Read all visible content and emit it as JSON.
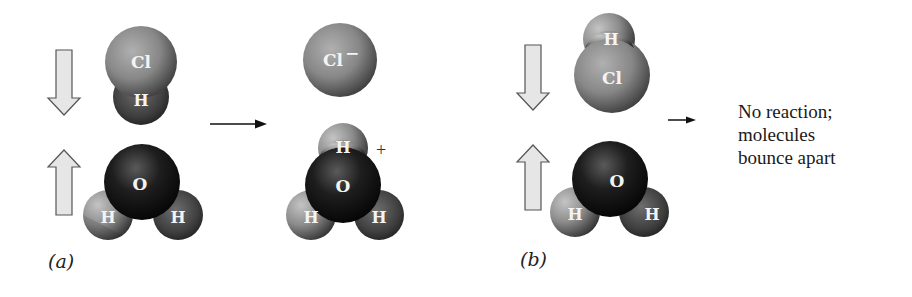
{
  "figure": {
    "panels": [
      {
        "id": "a",
        "label": "(a)",
        "reactants": [
          {
            "name": "hydrogen chloride",
            "atoms": [
              "Cl",
              "H"
            ],
            "motion": "down"
          },
          {
            "name": "water",
            "atoms": [
              "O",
              "H",
              "H"
            ],
            "motion": "up"
          }
        ],
        "arrow": "reaction-arrow",
        "products": [
          {
            "name": "chloride ion",
            "atoms": [
              "Cl"
            ],
            "label": "Cl",
            "charge": "−"
          },
          {
            "name": "hydronium ion",
            "atoms": [
              "H",
              "O",
              "H",
              "H"
            ],
            "charge": "+"
          }
        ]
      },
      {
        "id": "b",
        "label": "(b)",
        "reactants": [
          {
            "name": "hydrogen chloride",
            "atoms": [
              "H",
              "Cl"
            ],
            "motion": "down"
          },
          {
            "name": "water",
            "atoms": [
              "O",
              "H",
              "H"
            ],
            "motion": "up"
          }
        ],
        "arrow": "reaction-arrow",
        "outcome_lines": [
          "No reaction;",
          "molecules",
          "bounce apart"
        ]
      }
    ],
    "atom_labels": {
      "cl": "Cl",
      "h": "H",
      "o": "O",
      "cl_minus": "Cl",
      "minus": "−",
      "plus": "+"
    },
    "colors": {
      "chlorine": "#8a8a8a",
      "hydrogen": "#7a7a7a",
      "oxygen": "#1a1a1a",
      "arrow_fill": "#e6e6e6",
      "arrow_stroke": "#555555",
      "text": "#1a1a1a"
    }
  }
}
